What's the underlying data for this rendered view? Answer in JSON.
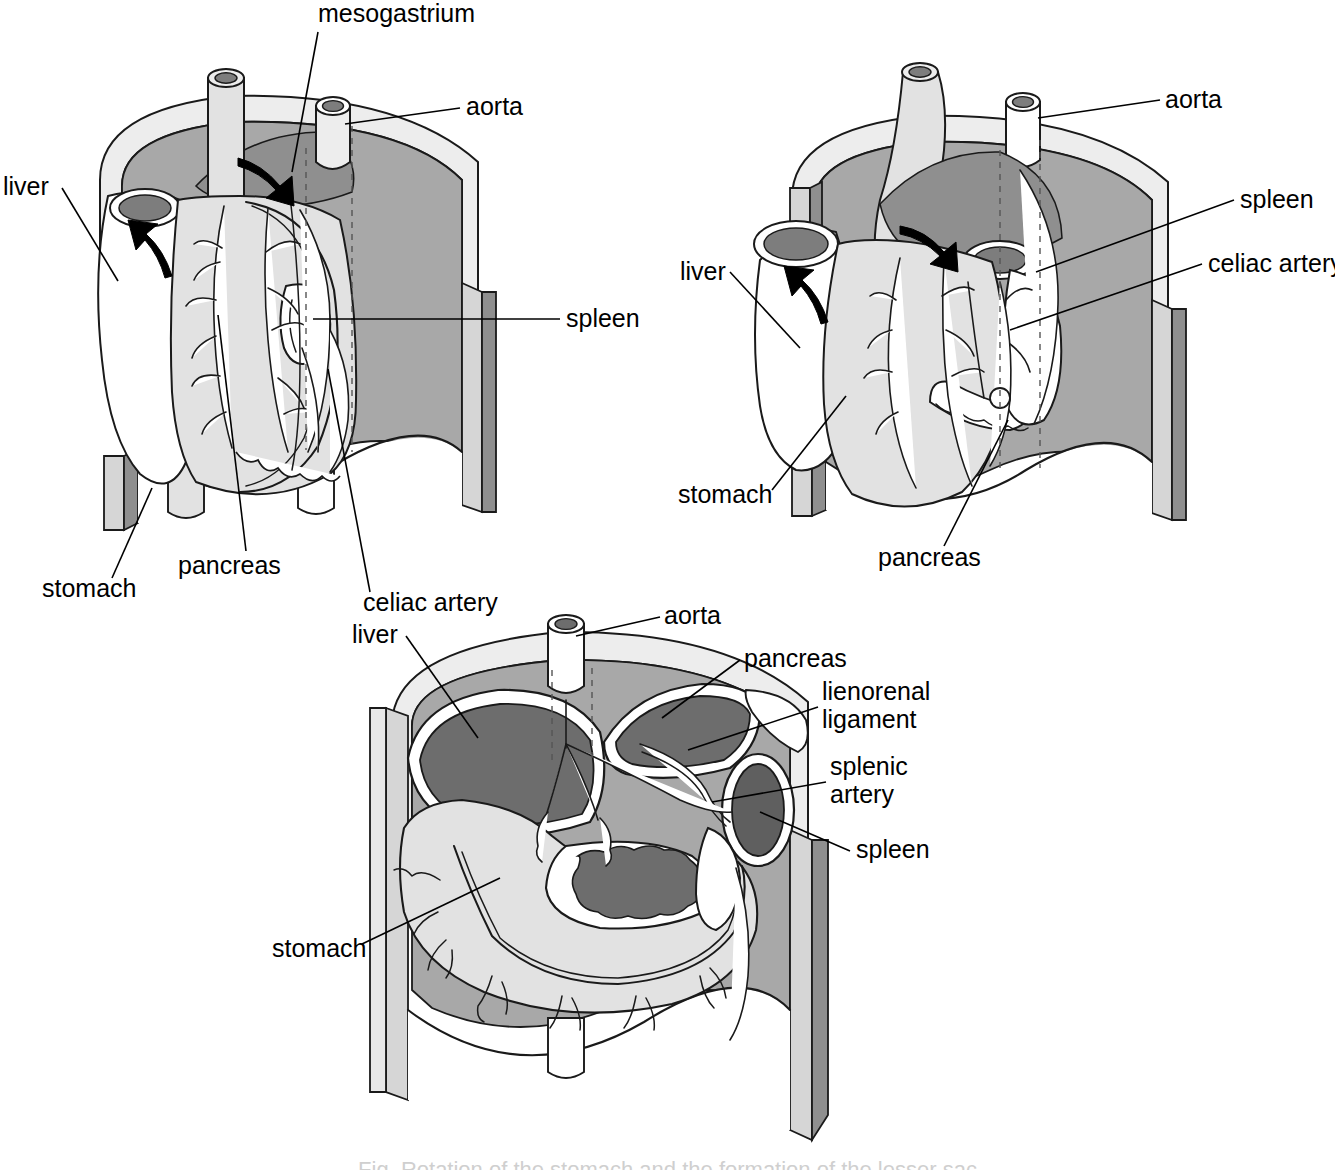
{
  "figure": {
    "domain": "anatomical-line-diagram",
    "panel_count": 3,
    "caption_cropped": "Fig. Rotation of the stomach and the formation of the lesser sac"
  },
  "palette": {
    "ink": "#1a1a1a",
    "organ_light": "#e2e2e2",
    "organ_mid": "#d2d2d2",
    "cavity_gray": "#a8a8a8",
    "cavity_gray_dark": "#8f8f8f",
    "lumen_dark": "#7d7d7d",
    "white": "#ffffff",
    "dash_gray": "#555555",
    "leader": "#000000"
  },
  "panels": [
    {
      "id": "panel-top-left",
      "name": "early-stage-median-mesogastrium",
      "stage_label": "stage 1",
      "labels": [
        {
          "key": "mesogastrium",
          "text": "mesogastrium",
          "x": 318,
          "y": 22,
          "anchor": "start",
          "leader": "M 318 32 L 292 172"
        },
        {
          "key": "aorta",
          "text": "aorta",
          "x": 466,
          "y": 115,
          "anchor": "start",
          "leader": "M 460 108 L 345 124"
        },
        {
          "key": "liver",
          "text": "liver",
          "x": 3,
          "y": 195,
          "anchor": "start",
          "leader": "M 62 188 L 118 281"
        },
        {
          "key": "spleen",
          "text": "spleen",
          "x": 566,
          "y": 327,
          "anchor": "start",
          "leader": "M 560 319 L 313 319"
        },
        {
          "key": "pancreas",
          "text": "pancreas",
          "x": 178,
          "y": 574,
          "anchor": "start",
          "leader": "M 246 551 L 218 315"
        },
        {
          "key": "stomach",
          "text": "stomach",
          "x": 42,
          "y": 597,
          "anchor": "start",
          "leader": "M 112 578 L 152 488"
        },
        {
          "key": "celiac-artery",
          "text": "celiac artery",
          "x": 363,
          "y": 611,
          "anchor": "start",
          "leader": "M 370 592 L 328 369"
        }
      ],
      "arrows": [
        {
          "key": "rotation-arrow-right",
          "dir": "down-right"
        },
        {
          "key": "rotation-arrow-left",
          "dir": "up-left"
        }
      ]
    },
    {
      "id": "panel-top-right",
      "name": "rotated-stage-lesser-sac-forming",
      "stage_label": "stage 2",
      "labels": [
        {
          "key": "aorta",
          "text": "aorta",
          "x": 1165,
          "y": 108,
          "anchor": "start",
          "leader": "M 1160 100 L 1038 118"
        },
        {
          "key": "spleen",
          "text": "spleen",
          "x": 1240,
          "y": 208,
          "anchor": "start",
          "leader": "M 1234 200 L 1055 272"
        },
        {
          "key": "celiac-artery",
          "text": "celiac artery",
          "x": 1208,
          "y": 272,
          "anchor": "start",
          "leader": "M 1202 264 L 1010 330"
        },
        {
          "key": "liver",
          "text": "liver",
          "x": 680,
          "y": 280,
          "anchor": "start",
          "leader": "M 730 272 L 800 348"
        },
        {
          "key": "stomach",
          "text": "stomach",
          "x": 678,
          "y": 503,
          "anchor": "start",
          "leader": "M 772 490 L 840 398"
        },
        {
          "key": "pancreas",
          "text": "pancreas",
          "x": 878,
          "y": 566,
          "anchor": "start",
          "leader": "M 944 546 L 1008 420"
        }
      ],
      "arrows": [
        {
          "key": "rotation-arrow-right",
          "dir": "down-right"
        },
        {
          "key": "rotation-arrow-left",
          "dir": "up-left"
        }
      ]
    },
    {
      "id": "panel-bottom",
      "name": "transverse-section-lesser-sac",
      "stage_label": "stage 3",
      "labels": [
        {
          "key": "aorta",
          "text": "aorta",
          "x": 664,
          "y": 624,
          "anchor": "start",
          "leader": "M 660 617 L 576 636"
        },
        {
          "key": "liver",
          "text": "liver",
          "x": 352,
          "y": 643,
          "anchor": "start",
          "leader": "M 406 636 L 478 730"
        },
        {
          "key": "pancreas",
          "text": "pancreas",
          "x": 744,
          "y": 667,
          "anchor": "start",
          "leader": "M 740 660 L 652 712"
        },
        {
          "key": "lienorenal-ligament-1",
          "text": "lienorenal",
          "x": 822,
          "y": 700,
          "anchor": "start",
          "leader": "M 818 707 L 694 748"
        },
        {
          "key": "lienorenal-ligament-2",
          "text": "ligament",
          "x": 822,
          "y": 728,
          "anchor": "start",
          "leader": ""
        },
        {
          "key": "splenic-artery-1",
          "text": "splenic",
          "x": 830,
          "y": 775,
          "anchor": "start",
          "leader": "M 826 782 L 718 800"
        },
        {
          "key": "splenic-artery-2",
          "text": "artery",
          "x": 830,
          "y": 803,
          "anchor": "start",
          "leader": ""
        },
        {
          "key": "spleen",
          "text": "spleen",
          "x": 856,
          "y": 858,
          "anchor": "start",
          "leader": "M 850 851 L 758 812"
        },
        {
          "key": "stomach",
          "text": "stomach",
          "x": 272,
          "y": 957,
          "anchor": "start",
          "leader": "M 362 944 L 500 875"
        }
      ],
      "arrows": []
    }
  ],
  "structures": {
    "organs": [
      "liver",
      "stomach",
      "spleen",
      "pancreas"
    ],
    "vessels": [
      "aorta",
      "celiac artery",
      "splenic artery"
    ],
    "membranes": [
      "mesogastrium",
      "lienorenal ligament"
    ]
  }
}
